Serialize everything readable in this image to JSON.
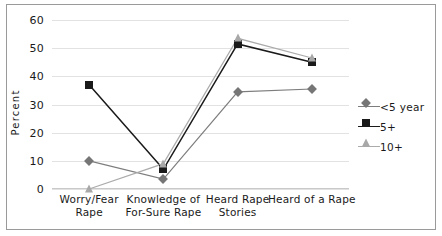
{
  "chart_data": {
    "type": "line",
    "title": "",
    "xlabel": "",
    "ylabel": "Percent",
    "ylim": [
      0,
      60
    ],
    "yticks": [
      0,
      10,
      20,
      30,
      40,
      50,
      60
    ],
    "grid": true,
    "legend_position": "right",
    "categories": [
      "Worry/Fear Rape",
      "Knowledge of For-Sure Rape",
      "Heard Rape Stories",
      "Heard of a Rape"
    ],
    "category_lines": [
      [
        "Worry/Fear",
        "Rape"
      ],
      [
        "Knowledge of",
        "For-Sure Rape"
      ],
      [
        "Heard Rape",
        "Stories"
      ],
      [
        "Heard of a Rape",
        ""
      ]
    ],
    "series": [
      {
        "name": "<5 year",
        "marker": "diamond",
        "color": "#767676",
        "line_color": "#7d7d7d",
        "values": [
          10,
          3.5,
          34.5,
          35.5
        ]
      },
      {
        "name": "5+",
        "marker": "square",
        "color": "#1a1a1a",
        "line_color": "#1a1a1a",
        "values": [
          37,
          7,
          51.5,
          45
        ]
      },
      {
        "name": "10+",
        "marker": "triangle",
        "color": "#a8a8a8",
        "line_color": "#ababab",
        "values": [
          0,
          9,
          53.5,
          46.5
        ]
      }
    ]
  },
  "axis": {
    "y_tick_labels": [
      "0",
      "10",
      "20",
      "30",
      "40",
      "50",
      "60"
    ],
    "y_title": "Percent"
  },
  "legend": {
    "items": [
      {
        "label": "<5 year",
        "marker": "diamond-icon",
        "color": "#767676"
      },
      {
        "label": "5+",
        "marker": "square-icon",
        "color": "#1a1a1a"
      },
      {
        "label": "10+",
        "marker": "triangle-icon",
        "color": "#a8a8a8"
      }
    ]
  },
  "colors": {
    "grid": "#e2e2e2",
    "axis": "#c9c9c9",
    "border": "#9a9a9a",
    "background": "#ffffff",
    "text": "#1a1a1a"
  }
}
